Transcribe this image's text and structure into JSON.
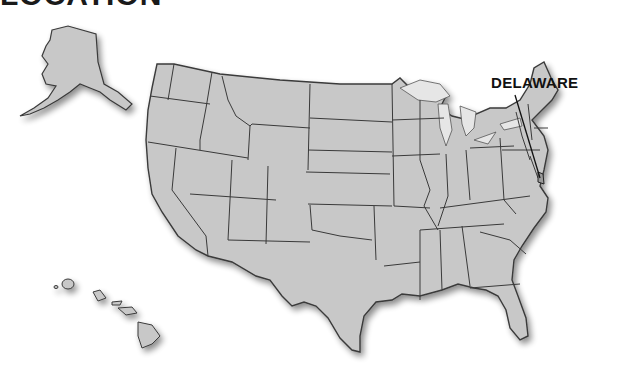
{
  "heading": "LOCATION",
  "map": {
    "type": "United States outline map",
    "highlighted_state": "Delaware",
    "label": "DELAWARE",
    "fill_color": "#c8c8c8",
    "border_color": "#3a3a3a",
    "water_color": "#e6e6e6",
    "insets": [
      "Alaska",
      "Hawaii"
    ]
  }
}
